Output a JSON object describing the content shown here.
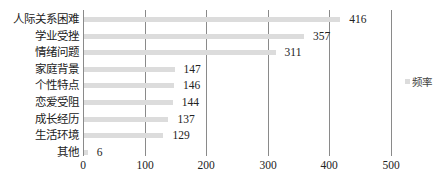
{
  "chart_data": {
    "type": "bar",
    "orientation": "horizontal",
    "title": "",
    "xlabel": "",
    "ylabel": "",
    "categories": [
      "人际关系困难",
      "学业受挫",
      "情绪问题",
      "家庭背景",
      "个性特点",
      "恋爱受阻",
      "成长经历",
      "生活环境",
      "其他"
    ],
    "series": [
      {
        "name": "频率",
        "values": [
          416,
          357,
          311,
          147,
          146,
          144,
          137,
          129,
          6
        ],
        "color": "#dcdcdc"
      }
    ],
    "xlim": [
      0,
      500
    ],
    "x_ticks": [
      "0",
      "100",
      "200",
      "300",
      "400",
      "500"
    ],
    "grid": true,
    "legend_position": "right",
    "data_labels": true
  },
  "legend": {
    "label": "频率"
  }
}
